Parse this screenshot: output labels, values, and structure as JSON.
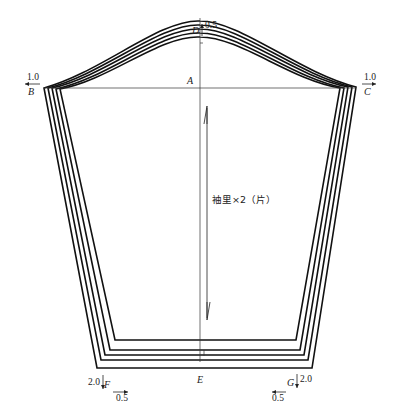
{
  "diagram": {
    "type": "sewing-pattern-grading",
    "piece_label": "袖里×2（片）",
    "points": {
      "A": "A",
      "B": "B",
      "C": "C",
      "D": "D",
      "E": "E",
      "F": "F",
      "G": "G"
    },
    "grading_increments": {
      "top_D": "0.5",
      "left_B": "1.0",
      "right_C": "1.0",
      "bottom_left_F_vertical": "2.0",
      "bottom_left_F_horizontal": "0.5",
      "bottom_right_G_vertical": "2.0",
      "bottom_right_G_horizontal": "0.5"
    },
    "nested_outlines": 5,
    "colors": {
      "line": "#111111",
      "background": "#ffffff"
    }
  }
}
